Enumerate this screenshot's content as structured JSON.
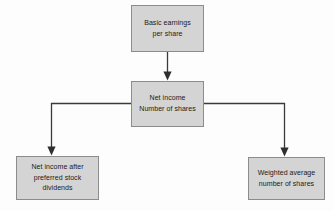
{
  "diagram": {
    "background_color": "#fdfdfd",
    "node_fill_color": "#d4d4d4",
    "node_border_color": "#8c8c8c",
    "connector_color": "#3a3a3a",
    "text_color": "#1a1a1a"
  },
  "nodes": {
    "basic_eps": {
      "label": "Basic earnings\nper share"
    },
    "net_income_over_shares": {
      "label": "Net income\nNumber of shares"
    },
    "net_income_after_preferred": {
      "label": "Net income after\npreferred stock\ndividends"
    },
    "weighted_average_shares": {
      "label": "Weighted average\nnumber of shares"
    }
  },
  "connectors": [
    {
      "name": "basic-eps-to-net-income",
      "from": "basic_eps",
      "to": "net_income_over_shares",
      "style": "straight-vertical-arrow"
    },
    {
      "name": "net-income-to-numerator",
      "from": "net_income_over_shares",
      "to": "net_income_after_preferred",
      "style": "elbow-left-down-arrow"
    },
    {
      "name": "net-income-to-denominator",
      "from": "net_income_over_shares",
      "to": "weighted_average_shares",
      "style": "elbow-right-down-arrow"
    }
  ]
}
